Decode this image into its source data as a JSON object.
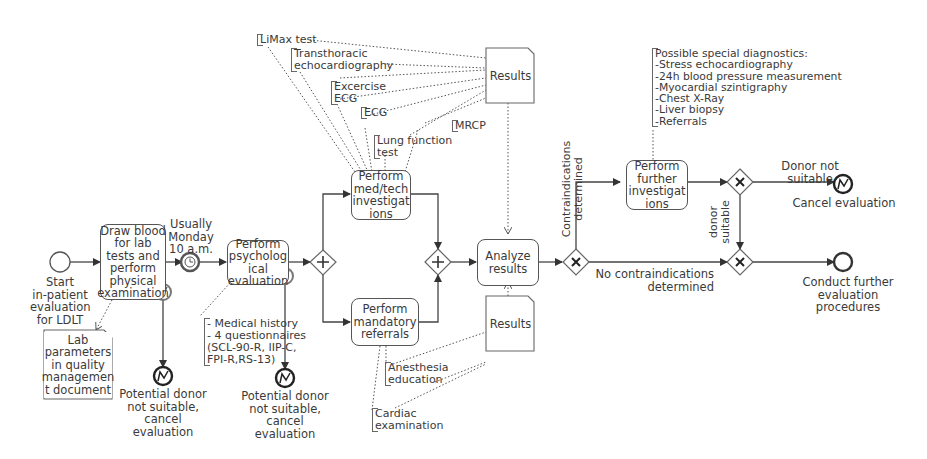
{
  "diagram": {
    "type": "BPMN process diagram",
    "start_event": {
      "label": "Start\nin-patient\nevaluation\nfor LDLT"
    },
    "tasks": {
      "draw_blood": "Draw blood\nfor lab\ntests and\nperform\nphysical\nexamination",
      "psych_eval": "Perform\npsycholog\nical\nevaluation",
      "med_tech": "Perform\nmed/tech\ninvestigat\nions",
      "mandatory_referrals": "Perform\nmandatory\nreferrals",
      "analyze_results": "Analyze\nresults",
      "further_investigations": "Perform\nfurther\ninvestigat\nions"
    },
    "timer_event": {
      "label": "Usually\nMonday\n10 a.m."
    },
    "documents": {
      "lab_params": "Lab\nparameters\nin quality\nmanagemen\nt document",
      "results_top": "Results",
      "results_bottom": "Results"
    },
    "annotations": {
      "psych": "- Medical history\n- 4 questionnaires\n(SCL-90-R, IIP-C,\nFPI-R,RS-13)",
      "limax": "LiMax test",
      "tte": "Transthoracic\nechocardiography",
      "exercise_ecg": "Excercise\nECG",
      "ecg": "ECG",
      "lung": "Lung function\ntest",
      "mrcp": "MRCP",
      "anesthesia": "Anesthesia\neducation",
      "cardiac": "Cardiac\nexamination",
      "special": "Possible special diagnostics:\n-Stress echocardiography\n-24h blood pressure measurement\n-Myocardial szintigraphy\n-Chest X-Ray\n-Liver biopsy\n-Referrals"
    },
    "end_events": {
      "cancel1": "Potential donor\nnot suitable,\ncancel evaluation",
      "cancel2": "Potential donor\nnot suitable,\ncancel evaluation",
      "cancel3": "Cancel evaluation",
      "conduct": "Conduct further\nevaluation procedures"
    },
    "flow_labels": {
      "contraindications": "Contraindications\ndetermined",
      "no_contraindications": "No contraindications\ndetermined",
      "donor_not_suitable": "Donor not\nsuitable",
      "donor_suitable": "donor\nsuitable"
    },
    "colors": {
      "stroke": "#555555",
      "text": "#3a3a3a",
      "background": "#ffffff"
    }
  }
}
